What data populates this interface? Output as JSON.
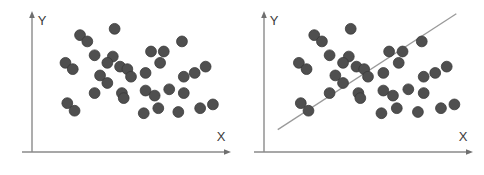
{
  "figure": {
    "background_color": "#ffffff",
    "width": 484,
    "height": 175,
    "panel_count": 2
  },
  "style": {
    "point_color": "#4f4f4f",
    "point_edge_color": "#3a3a3a",
    "point_radius": 5.4,
    "axis_color": "#8a8a8a",
    "line_color": "#9a9a9a",
    "label_color": "#3b3b3b"
  },
  "chart_data": [
    {
      "id": "left-panel",
      "type": "scatter",
      "title": "",
      "xlabel": "X",
      "ylabel": "Y",
      "xlim": [
        0,
        100
      ],
      "ylim": [
        0,
        100
      ],
      "grid": false,
      "legend": "none",
      "axis_arrows": true,
      "annotations": [],
      "series": [
        {
          "name": "observations",
          "color": "#4f4f4f",
          "points": [
            [
              22,
              88
            ],
            [
              26,
              83
            ],
            [
              41,
              93
            ],
            [
              14,
              66
            ],
            [
              18,
              61
            ],
            [
              30,
              72
            ],
            [
              40,
              71
            ],
            [
              37,
              66
            ],
            [
              44,
              63
            ],
            [
              48,
              61
            ],
            [
              61,
              75
            ],
            [
              68,
              75
            ],
            [
              78,
              83
            ],
            [
              58,
              58
            ],
            [
              66,
              66
            ],
            [
              33,
              56
            ],
            [
              37,
              50
            ],
            [
              30,
              42
            ],
            [
              85,
              58
            ],
            [
              79,
              55
            ],
            [
              91,
              63
            ],
            [
              50,
              55
            ],
            [
              45,
              42
            ],
            [
              46,
              38
            ],
            [
              58,
              44
            ],
            [
              63,
              40
            ],
            [
              71,
              45
            ],
            [
              79,
              42
            ],
            [
              15,
              34
            ],
            [
              19,
              28
            ],
            [
              65,
              30
            ],
            [
              76,
              27
            ],
            [
              88,
              30
            ],
            [
              95,
              33
            ],
            [
              57,
              26
            ]
          ]
        }
      ]
    },
    {
      "id": "right-panel",
      "type": "scatter",
      "title": "",
      "xlabel": "X",
      "ylabel": "Y",
      "xlim": [
        0,
        100
      ],
      "ylim": [
        0,
        100
      ],
      "grid": false,
      "legend": "none",
      "axis_arrows": true,
      "annotations": [
        {
          "kind": "decision-boundary-line",
          "label": "",
          "x0": 3,
          "y0": 13,
          "x1": 96,
          "y1": 105,
          "color": "#9a9a9a"
        }
      ],
      "series": [
        {
          "name": "observations",
          "color": "#4f4f4f",
          "points": [
            [
              22,
              88
            ],
            [
              26,
              83
            ],
            [
              41,
              93
            ],
            [
              14,
              66
            ],
            [
              18,
              61
            ],
            [
              30,
              72
            ],
            [
              40,
              71
            ],
            [
              37,
              66
            ],
            [
              44,
              63
            ],
            [
              48,
              61
            ],
            [
              61,
              75
            ],
            [
              68,
              75
            ],
            [
              78,
              83
            ],
            [
              58,
              58
            ],
            [
              66,
              66
            ],
            [
              33,
              56
            ],
            [
              37,
              50
            ],
            [
              30,
              42
            ],
            [
              85,
              58
            ],
            [
              79,
              55
            ],
            [
              91,
              63
            ],
            [
              50,
              55
            ],
            [
              45,
              42
            ],
            [
              46,
              38
            ],
            [
              58,
              44
            ],
            [
              63,
              40
            ],
            [
              71,
              45
            ],
            [
              79,
              42
            ],
            [
              15,
              34
            ],
            [
              19,
              28
            ],
            [
              65,
              30
            ],
            [
              76,
              27
            ],
            [
              88,
              30
            ],
            [
              95,
              33
            ],
            [
              57,
              26
            ]
          ]
        }
      ]
    }
  ]
}
